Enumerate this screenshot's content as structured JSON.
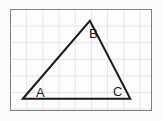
{
  "figure": {
    "background_color": "#fbfbfb",
    "panel": {
      "border_color": "#7e8084",
      "fill_color": "#fdfdfd",
      "grid_color": "#e3e4e8",
      "grid_spacing_px": 16
    },
    "stroke_color": "#1a1a1a",
    "stroke_width": 2,
    "vertices": [
      {
        "label": "A",
        "x": 12,
        "y": 90,
        "position": "bottom-left"
      },
      {
        "label": "B",
        "x": 80,
        "y": 11,
        "position": "apex-top"
      },
      {
        "label": "C",
        "x": 121,
        "y": 90,
        "position": "bottom-right"
      }
    ],
    "edges": [
      {
        "name": "AB",
        "from": "A",
        "to": "B"
      },
      {
        "name": "BC",
        "from": "B",
        "to": "C"
      },
      {
        "name": "CA",
        "from": "C",
        "to": "A"
      }
    ],
    "labels": {
      "a": "A",
      "b": "B",
      "c": "C"
    }
  }
}
